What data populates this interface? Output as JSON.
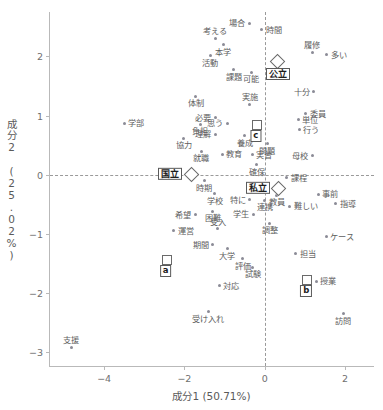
{
  "chart_data": {
    "type": "scatter",
    "title": "",
    "xlabel": "成分1 (50.71%)",
    "ylabel": "成分2 (25.02%)",
    "xlim": [
      -5.35,
      2.75
    ],
    "ylim": [
      -3.25,
      2.75
    ],
    "xticks": [
      -4,
      -2,
      0,
      2
    ],
    "xtick_labels": [
      "−4",
      "−2",
      "0",
      "2"
    ],
    "yticks": [
      2,
      1,
      0,
      -1,
      -2,
      -3
    ],
    "ytick_labels": [
      "2",
      "1",
      "0",
      "−1",
      "−2",
      "−3"
    ],
    "grid": false,
    "zero_lines": true,
    "legend": "none",
    "word_points": [
      {
        "label": "場合",
        "x": -0.39,
        "y": 2.56,
        "pos": "l"
      },
      {
        "label": "時間",
        "x": -0.07,
        "y": 2.45,
        "pos": "r"
      },
      {
        "label": "考える",
        "x": -1.23,
        "y": 2.31,
        "pos": "t"
      },
      {
        "label": "本学",
        "x": -1.03,
        "y": 2.2,
        "pos": "b"
      },
      {
        "label": "履修",
        "x": 1.18,
        "y": 2.07,
        "pos": "t"
      },
      {
        "label": "多い",
        "x": 1.55,
        "y": 2.03,
        "pos": "r"
      },
      {
        "label": "活動",
        "x": -1.36,
        "y": 2.01,
        "pos": "b"
      },
      {
        "label": "課題",
        "x": -0.77,
        "y": 1.77,
        "pos": "b"
      },
      {
        "label": "可能",
        "x": -0.33,
        "y": 1.73,
        "pos": "b"
      },
      {
        "label": "十分",
        "x": 1.22,
        "y": 1.4,
        "pos": "l"
      },
      {
        "label": "体制",
        "x": -1.72,
        "y": 1.33,
        "pos": "b"
      },
      {
        "label": "実施",
        "x": -0.37,
        "y": 1.19,
        "pos": "t"
      },
      {
        "label": "委員",
        "x": 1.03,
        "y": 1.03,
        "pos": "r"
      },
      {
        "label": "必要",
        "x": -1.23,
        "y": 0.96,
        "pos": "l"
      },
      {
        "label": "単位",
        "x": 0.84,
        "y": 0.93,
        "pos": "r"
      },
      {
        "label": "学部",
        "x": -3.5,
        "y": 0.87,
        "pos": "r"
      },
      {
        "label": "負担",
        "x": -1.6,
        "y": 0.85,
        "pos": "b"
      },
      {
        "label": "思う",
        "x": -0.93,
        "y": 0.87,
        "pos": "l"
      },
      {
        "label": "行う",
        "x": 0.86,
        "y": 0.76,
        "pos": "r"
      },
      {
        "label": "理解",
        "x": -1.23,
        "y": 0.68,
        "pos": "l"
      },
      {
        "label": "養成",
        "x": -0.5,
        "y": 0.66,
        "pos": "b"
      },
      {
        "label": "協力",
        "x": -2.02,
        "y": 0.62,
        "pos": "b"
      },
      {
        "label": "問題",
        "x": 0.06,
        "y": 0.52,
        "pos": "b"
      },
      {
        "label": "就職",
        "x": -1.58,
        "y": 0.4,
        "pos": "b"
      },
      {
        "label": "教育",
        "x": -1.06,
        "y": 0.35,
        "pos": "r"
      },
      {
        "label": "実習",
        "x": -0.31,
        "y": 0.34,
        "pos": "r"
      },
      {
        "label": "母校",
        "x": 1.18,
        "y": 0.32,
        "pos": "l"
      },
      {
        "label": "確保",
        "x": -0.2,
        "y": 0.17,
        "pos": "b"
      },
      {
        "label": "時期",
        "x": -1.5,
        "y": -0.1,
        "pos": "b"
      },
      {
        "label": "課程",
        "x": 0.55,
        "y": -0.05,
        "pos": "r"
      },
      {
        "label": "教員",
        "x": 0.3,
        "y": -0.35,
        "pos": "b"
      },
      {
        "label": "事前",
        "x": 1.33,
        "y": -0.33,
        "pos": "r"
      },
      {
        "label": "学校",
        "x": -1.24,
        "y": -0.32,
        "pos": "b"
      },
      {
        "label": "連携",
        "x": 0.0,
        "y": -0.43,
        "pos": "b"
      },
      {
        "label": "特に",
        "x": -0.37,
        "y": -0.42,
        "pos": "l"
      },
      {
        "label": "指導",
        "x": 1.77,
        "y": -0.49,
        "pos": "r"
      },
      {
        "label": "難しい",
        "x": 0.62,
        "y": -0.53,
        "pos": "r"
      },
      {
        "label": "困難",
        "x": -1.29,
        "y": -0.62,
        "pos": "b"
      },
      {
        "label": "希望",
        "x": -1.73,
        "y": -0.68,
        "pos": "l"
      },
      {
        "label": "学生",
        "x": -0.28,
        "y": -0.67,
        "pos": "l"
      },
      {
        "label": "調整",
        "x": 0.13,
        "y": -0.82,
        "pos": "b"
      },
      {
        "label": "受入",
        "x": -1.17,
        "y": -0.91,
        "pos": "t"
      },
      {
        "label": "運営",
        "x": -2.26,
        "y": -0.95,
        "pos": "r"
      },
      {
        "label": "ケース",
        "x": 1.53,
        "y": -1.05,
        "pos": "r"
      },
      {
        "label": "期間",
        "x": -1.3,
        "y": -1.18,
        "pos": "l"
      },
      {
        "label": "大学",
        "x": -0.93,
        "y": -1.25,
        "pos": "b"
      },
      {
        "label": "担当",
        "x": 0.78,
        "y": -1.34,
        "pos": "r"
      },
      {
        "label": "評価",
        "x": -0.54,
        "y": -1.42,
        "pos": "b"
      },
      {
        "label": "試験",
        "x": -0.3,
        "y": -1.56,
        "pos": "b"
      },
      {
        "label": "授業",
        "x": 1.28,
        "y": -1.8,
        "pos": "r"
      },
      {
        "label": "対応",
        "x": -1.13,
        "y": -1.88,
        "pos": "r"
      },
      {
        "label": "受け入れ",
        "x": -1.4,
        "y": -2.32,
        "pos": "b"
      },
      {
        "label": "訪問",
        "x": 1.96,
        "y": -2.35,
        "pos": "b"
      },
      {
        "label": "支援",
        "x": -4.82,
        "y": -2.92,
        "pos": "t"
      }
    ],
    "group_points": [
      {
        "label": "公立",
        "x": 0.3,
        "y": 1.93,
        "marker": "diamond",
        "label_pos": "below-right"
      },
      {
        "label": "国立",
        "x": -1.85,
        "y": 0.02,
        "marker": "diamond",
        "label_pos": "left"
      },
      {
        "label": "私立",
        "x": 0.32,
        "y": -0.22,
        "marker": "diamond",
        "label_pos": "left"
      }
    ],
    "cluster_points": [
      {
        "label": "c",
        "x": -0.22,
        "y": 0.86,
        "marker": "square",
        "label_pos": "below"
      },
      {
        "label": "a",
        "x": -2.47,
        "y": -1.43,
        "marker": "square",
        "label_pos": "below"
      },
      {
        "label": "b",
        "x": 1.04,
        "y": -1.76,
        "marker": "square",
        "label_pos": "below"
      }
    ]
  },
  "colors": {
    "point": "#8b8b96",
    "text": "#5e5e5e",
    "axis": "#b9b9b9",
    "zero_line": "#9a9a9a",
    "marker_stroke": "#6a6a6a"
  }
}
